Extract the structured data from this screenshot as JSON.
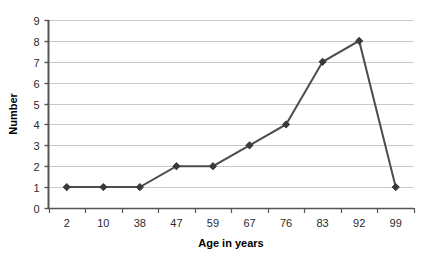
{
  "chart_data": {
    "type": "line",
    "title": "",
    "xlabel": "Age in years",
    "ylabel": "Number",
    "categories": [
      "2",
      "10",
      "38",
      "47",
      "59",
      "67",
      "76",
      "83",
      "92",
      "99"
    ],
    "values": [
      1,
      1,
      1,
      2,
      2,
      3,
      4,
      7,
      8,
      1
    ],
    "series": [
      {
        "name": "Number",
        "values": [
          1,
          1,
          1,
          2,
          2,
          3,
          4,
          7,
          8,
          1
        ]
      }
    ],
    "ylim": [
      0,
      9
    ],
    "yticks": [
      "0",
      "1",
      "2",
      "3",
      "4",
      "5",
      "6",
      "7",
      "8",
      "9"
    ],
    "grid": "horizontal",
    "legend": "none",
    "marker": "diamond",
    "colors": {
      "line": "#4d4d4d",
      "marker": "#3a3a3a",
      "grid": "#c9c9c9",
      "axis": "#555555",
      "text": "#2b2b2b",
      "background": "#ffffff"
    }
  }
}
